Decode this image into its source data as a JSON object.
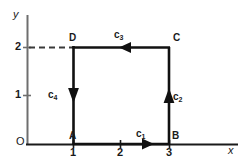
{
  "figure": {
    "type": "line-diagram",
    "axes": {
      "x_label": "x",
      "y_label": "y",
      "origin_label": "O",
      "x_ticks": [
        "1",
        "2",
        "3"
      ],
      "y_ticks": [
        "1",
        "2"
      ],
      "x_axis_color": "#1a1a1a",
      "y_axis_color": "#6e6e6e"
    },
    "vertices": [
      {
        "name": "A",
        "label": "A",
        "x": 1,
        "y": 0
      },
      {
        "name": "B",
        "label": "B",
        "x": 3,
        "y": 0
      },
      {
        "name": "C",
        "label": "C",
        "x": 3,
        "y": 2
      },
      {
        "name": "D",
        "label": "D",
        "x": 1,
        "y": 2
      }
    ],
    "edges": [
      {
        "name": "c1",
        "label": "c",
        "sub": "1",
        "from": "A",
        "to": "B",
        "direction": "right"
      },
      {
        "name": "c2",
        "label": "c",
        "sub": "2",
        "from": "B",
        "to": "C",
        "direction": "up"
      },
      {
        "name": "c3",
        "label": "c",
        "sub": "3",
        "from": "C",
        "to": "D",
        "direction": "left"
      },
      {
        "name": "c4",
        "label": "c",
        "sub": "4",
        "from": "D",
        "to": "A",
        "direction": "down"
      }
    ],
    "guides": [
      {
        "name": "dashed-y2",
        "from_x": 0,
        "to_x": 1,
        "at_y": 2,
        "style": "dashed"
      }
    ],
    "colors": {
      "path_stroke": "#111111",
      "axis_stroke": "#1a1a1a",
      "y_axis_stroke": "#6e6e6e",
      "dash_stroke": "#3a3a3a",
      "background": "#ffffff"
    }
  }
}
